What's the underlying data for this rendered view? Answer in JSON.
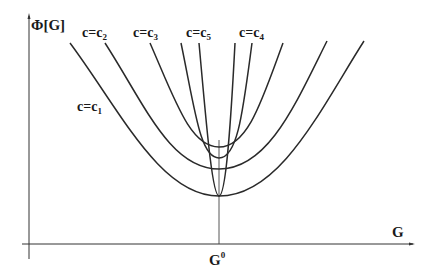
{
  "figure": {
    "y_axis_label": "Φ[G]",
    "x_axis_label": "G",
    "x_marker_label": "G",
    "x_marker_superscript": "0",
    "curve_labels": [
      {
        "id": "c1",
        "prefix": "c=c",
        "subscript": "1"
      },
      {
        "id": "c2",
        "prefix": "c=c",
        "subscript": "2"
      },
      {
        "id": "c3",
        "prefix": "c=c",
        "subscript": "3"
      },
      {
        "id": "c5",
        "prefix": "c=c",
        "subscript": "5"
      },
      {
        "id": "c4",
        "prefix": "c=c",
        "subscript": "4"
      }
    ],
    "colors": {
      "line": "#2a2a2a",
      "background": "#ffffff"
    }
  }
}
